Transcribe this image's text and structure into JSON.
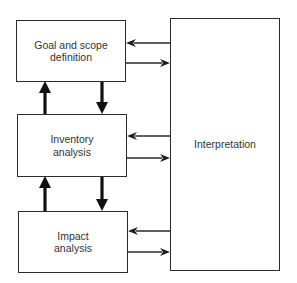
{
  "diagram": {
    "type": "flowchart",
    "title": "",
    "nodes": [
      {
        "id": "goal",
        "label_line1": "Goal and scope",
        "label_line2": "definition"
      },
      {
        "id": "inventory",
        "label_line1": "Inventory",
        "label_line2": "analysis"
      },
      {
        "id": "impact",
        "label_line1": "Impact",
        "label_line2": "analysis"
      },
      {
        "id": "interpretation",
        "label": "Interpretation"
      }
    ],
    "edges": [
      {
        "from": "goal",
        "to": "inventory",
        "style": "thick"
      },
      {
        "from": "inventory",
        "to": "goal",
        "style": "thick"
      },
      {
        "from": "inventory",
        "to": "impact",
        "style": "thick"
      },
      {
        "from": "impact",
        "to": "inventory",
        "style": "thick"
      },
      {
        "from": "goal",
        "to": "interpretation",
        "style": "thin"
      },
      {
        "from": "interpretation",
        "to": "goal",
        "style": "thin"
      },
      {
        "from": "inventory",
        "to": "interpretation",
        "style": "thin"
      },
      {
        "from": "interpretation",
        "to": "inventory",
        "style": "thin"
      },
      {
        "from": "impact",
        "to": "interpretation",
        "style": "thin"
      },
      {
        "from": "interpretation",
        "to": "impact",
        "style": "thin"
      }
    ],
    "colors": {
      "stroke": "#2b2b2b",
      "background": "#ffffff"
    }
  }
}
